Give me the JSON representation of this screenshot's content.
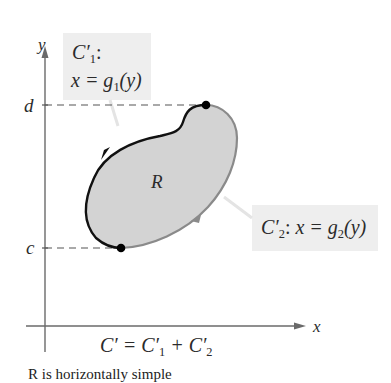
{
  "figure": {
    "axes": {
      "x_label": "x",
      "y_label": "y",
      "y_ticks": [
        {
          "label": "d",
          "position": "top"
        },
        {
          "label": "c",
          "position": "bottom"
        }
      ]
    },
    "region": {
      "label": "R",
      "fill_color": "#d3d3d3"
    },
    "curves": [
      {
        "name": "C'1",
        "prime_letter": "C′",
        "subscript": "1",
        "colon": ":",
        "equation_prefix": "x = g",
        "equation_sub": "1",
        "equation_suffix": "(y)",
        "color": "#111111",
        "direction": "counterclockwise, top to bottom along left side"
      },
      {
        "name": "C'2",
        "prime_letter": "C′",
        "subscript": "2",
        "colon": ": ",
        "equation_prefix": "x = g",
        "equation_sub": "2",
        "equation_suffix": "(y)",
        "color": "#8a8a8a",
        "direction": "bottom to top along right side"
      }
    ],
    "sum_label": {
      "lhs": "C′ = C′",
      "sub1": "1",
      "plus": " + C′",
      "sub2": "2"
    },
    "callout_bg": "#eeeeee"
  },
  "caption_clipped": "R is horizontally simple"
}
